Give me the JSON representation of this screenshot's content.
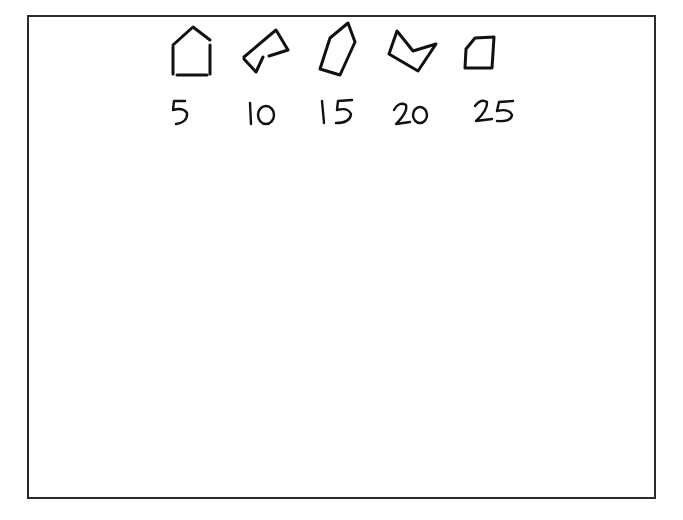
{
  "figure": {
    "frame": {
      "border_color": "#2a2a2a",
      "background": "#ffffff"
    },
    "items": [
      {
        "shape": "house-pentagon",
        "label": "5"
      },
      {
        "shape": "bent-irregular-hexagon",
        "label": "10"
      },
      {
        "shape": "tilted-pentagon",
        "label": "15"
      },
      {
        "shape": "concave-arrow-pentagon",
        "label": "20"
      },
      {
        "shape": "clipped-corner-quadrilateral",
        "label": "25"
      }
    ]
  }
}
